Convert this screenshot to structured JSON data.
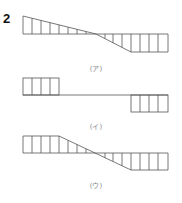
{
  "question_number": "2",
  "stroke_color": "#555555",
  "diagrams": [
    {
      "label": "(ア)",
      "baseline_y": 34,
      "top_y": 16,
      "bottom_y": 52,
      "shape": "linear-decreasing-through-zero",
      "points": [
        [
          23,
          16
        ],
        [
          96,
          34
        ],
        [
          131,
          52
        ],
        [
          168,
          52
        ],
        [
          168,
          34
        ]
      ],
      "verticals": [
        23,
        32,
        41,
        50,
        59,
        68,
        77,
        86,
        105,
        113,
        122,
        131,
        140,
        149,
        158,
        168
      ]
    },
    {
      "label": "(イ)",
      "baseline_y": 95,
      "top_y": 78,
      "bottom_y": 112,
      "shape": "step-positive-left-negative-right",
      "verticals_left": [
        23,
        32,
        41,
        50,
        59
      ],
      "verticals_right": [
        131,
        140,
        149,
        158,
        168
      ]
    },
    {
      "label": "(ウ)",
      "baseline_y": 153,
      "top_y": 136,
      "bottom_y": 170,
      "shape": "flat-then-linear-then-flat",
      "verticals": [
        23,
        32,
        41,
        50,
        59,
        68,
        77,
        86,
        105,
        113,
        122,
        131,
        140,
        149,
        158,
        168
      ]
    }
  ]
}
